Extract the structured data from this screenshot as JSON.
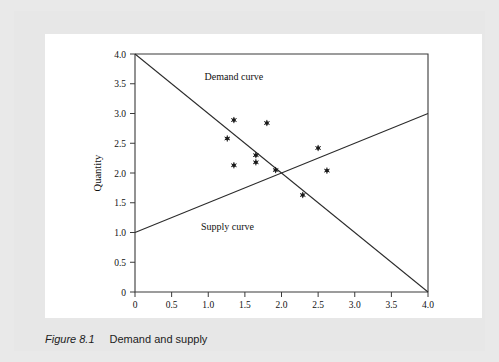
{
  "figure": {
    "caption_number": "Figure 8.1",
    "caption_text": "Demand and supply",
    "background_color": "#e7e7e7",
    "panel_color": "#ffffff"
  },
  "chart_data": {
    "type": "scatter",
    "title": "",
    "subtitle": "",
    "xlabel": "Price",
    "ylabel": "Quantity",
    "xlim": [
      0,
      4.0
    ],
    "ylim": [
      0,
      4.0
    ],
    "xticks": [
      "0",
      "0.5",
      "1.0",
      "1.5",
      "2.0",
      "2.5",
      "3.0",
      "3.5",
      "4.0"
    ],
    "xtick_values": [
      0,
      0.5,
      1.0,
      1.5,
      2.0,
      2.5,
      3.0,
      3.5,
      4.0
    ],
    "yticks": [
      "0",
      "0.5",
      "1.0",
      "1.5",
      "2.0",
      "2.5",
      "3.0",
      "3.5",
      "4.0"
    ],
    "ytick_values": [
      0,
      0.5,
      1.0,
      1.5,
      2.0,
      2.5,
      3.0,
      3.5,
      4.0
    ],
    "grid": false,
    "legend_position": "inline-annotations",
    "line_color": "#2b2b2b",
    "point_color": "#1a1a1a",
    "series": [
      {
        "name": "Demand curve",
        "type": "line",
        "annotation": "Demand curve",
        "annotation_at": [
          0.95,
          3.57
        ],
        "points": [
          [
            0,
            4.0
          ],
          [
            4.0,
            0
          ]
        ],
        "equation": "Quantity = 4.0 - 1.0 x Price"
      },
      {
        "name": "Supply curve",
        "type": "line",
        "annotation": "Supply curve",
        "annotation_at": [
          0.9,
          1.05
        ],
        "points": [
          [
            0,
            1.0
          ],
          [
            4.0,
            3.0
          ]
        ],
        "equation": "Quantity = 1.0 + 0.5 x Price"
      },
      {
        "name": "Observed price-quantity pairs",
        "type": "scatter",
        "marker": "asterisk",
        "x": [
          1.26,
          1.35,
          1.35,
          1.65,
          1.65,
          1.8,
          1.92,
          2.29,
          2.5,
          2.62
        ],
        "y": [
          2.58,
          2.89,
          2.13,
          2.3,
          2.18,
          2.84,
          2.05,
          1.63,
          2.42,
          2.04
        ],
        "points": [
          [
            1.26,
            2.58
          ],
          [
            1.35,
            2.89
          ],
          [
            1.35,
            2.13
          ],
          [
            1.65,
            2.3
          ],
          [
            1.65,
            2.18
          ],
          [
            1.8,
            2.84
          ],
          [
            1.92,
            2.05
          ],
          [
            2.29,
            1.63
          ],
          [
            2.5,
            2.42
          ],
          [
            2.62,
            2.04
          ]
        ]
      }
    ],
    "equilibrium": {
      "price": 2.0,
      "quantity": 2.0
    }
  }
}
